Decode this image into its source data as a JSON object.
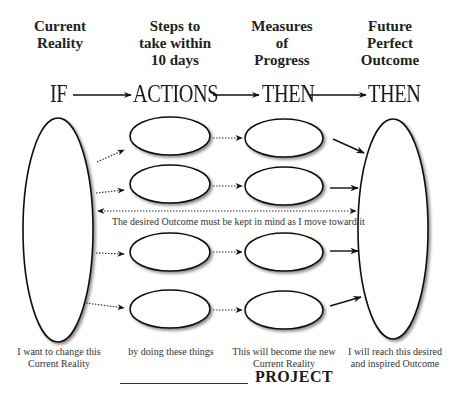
{
  "columns": [
    {
      "header": "Current\nReality",
      "stage": "IF",
      "caption": "I want to change this\nCurrent Reality"
    },
    {
      "header": "Steps to\ntake within\n10 days",
      "stage": "ACTIONS",
      "caption": "by doing these things"
    },
    {
      "header": "Measures\nof\nProgress",
      "stage": "THEN",
      "caption": "This will become the new\nCurrent Reality"
    },
    {
      "header": "Future\nPerfect\nOutcome",
      "stage": "THEN",
      "caption": "I will reach this desired\nand inspired Outcome"
    }
  ],
  "middle_note": "The desired Outcome must be kept in mind as I move toward it",
  "footer": {
    "project_label": "PROJECT"
  },
  "colors": {
    "stroke": "#111111",
    "shadow": "#9a9a9a",
    "text": "#222222"
  }
}
